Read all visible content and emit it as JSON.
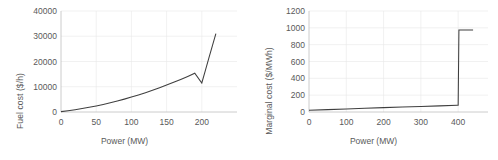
{
  "figure": {
    "background": "#ffffff",
    "line_color": "#3f3f3f",
    "grid_color": "#e8e8e8",
    "axis_color": "#bfbfbf",
    "text_color": "#595959"
  },
  "chart_data": [
    {
      "type": "line",
      "id": "fuel-cost-curve",
      "title": "",
      "xlabel": "Power (MW)",
      "ylabel": "Fuel cost ($/h)",
      "xlim": [
        0,
        250
      ],
      "ylim": [
        0,
        40000
      ],
      "xticks": [
        0,
        50,
        100,
        150,
        200
      ],
      "yticks": [
        0,
        10000,
        20000,
        30000,
        40000
      ],
      "xtick_labels": [
        "0",
        "50",
        "100",
        "150",
        "200"
      ],
      "ytick_labels": [
        "0",
        "10000",
        "20000",
        "30000",
        "40000"
      ],
      "grid": true,
      "legend": "none",
      "x": [
        0,
        10,
        20,
        30,
        40,
        50,
        60,
        70,
        80,
        90,
        100,
        110,
        120,
        130,
        140,
        150,
        160,
        170,
        180,
        190,
        200,
        205,
        210,
        215,
        220
      ],
      "values": [
        150,
        500,
        900,
        1350,
        1850,
        2400,
        3000,
        3650,
        4350,
        5100,
        5900,
        6750,
        7650,
        8600,
        9600,
        10650,
        11750,
        12900,
        14100,
        15350,
        11500,
        16400,
        21300,
        26200,
        31000
      ],
      "annotations": [
        {
          "label": "kink",
          "x": 200,
          "y": 11500
        },
        {
          "label": "endpoint",
          "x": 220,
          "y": 31000
        }
      ]
    },
    {
      "type": "line",
      "id": "marginal-cost-curve",
      "title": "",
      "xlabel": "Power (MW)",
      "ylabel": "Marginal cost ($/MWh)",
      "xlim": [
        0,
        480
      ],
      "ylim": [
        0,
        1200
      ],
      "xticks": [
        0,
        100,
        200,
        300,
        400
      ],
      "yticks": [
        0,
        200,
        400,
        600,
        800,
        1000,
        1200
      ],
      "xtick_labels": [
        "0",
        "100",
        "200",
        "300",
        "400"
      ],
      "ytick_labels": [
        "0",
        "200",
        "400",
        "600",
        "800",
        "1000",
        "1200"
      ],
      "grid": true,
      "legend": "none",
      "x": [
        0,
        50,
        100,
        150,
        200,
        250,
        300,
        350,
        398,
        400,
        402,
        440
      ],
      "values": [
        20,
        28,
        36,
        44,
        52,
        60,
        66,
        73,
        80,
        80,
        975,
        975
      ],
      "annotations": [
        {
          "label": "step-jump",
          "x": 400,
          "y": 975
        },
        {
          "label": "plateau",
          "x": 440,
          "y": 975
        }
      ]
    }
  ]
}
